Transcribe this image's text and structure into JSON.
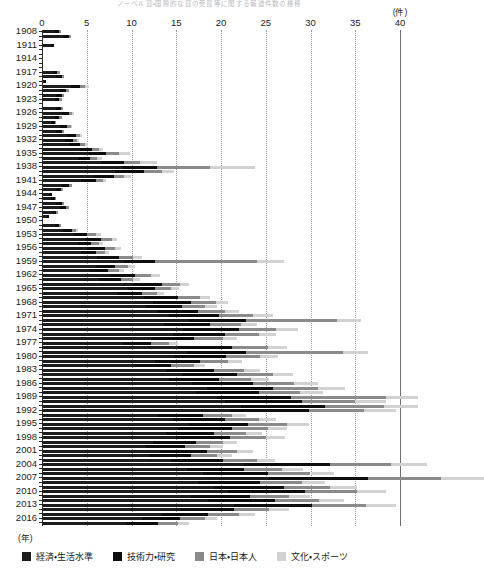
{
  "chart_title": "ノーベル賞・国際的な賞の受賞等に関する報道件数の推移",
  "axis": {
    "x_unit": "(件)",
    "y_unit": "(年)",
    "xticks": [
      0,
      5,
      10,
      15,
      20,
      25,
      30,
      35,
      40
    ],
    "xlim": [
      0,
      40
    ],
    "ytick_labels": [
      "1908",
      "1911",
      "1914",
      "1917",
      "1920",
      "1923",
      "1926",
      "1929",
      "1932",
      "1935",
      "1938",
      "1941",
      "1944",
      "1947",
      "1950",
      "1953",
      "1956",
      "1959",
      "1962",
      "1965",
      "1968",
      "1971",
      "1974",
      "1977",
      "1980",
      "1983",
      "1986",
      "1989",
      "1992",
      "1995",
      "1998",
      "2001",
      "2004",
      "2007",
      "2010",
      "2013",
      "2016"
    ]
  },
  "legend": {
    "items": [
      {
        "label": "経済・生活水準",
        "color": "#1c1c1c",
        "icon": "square-swatch-icon"
      },
      {
        "label": "技術力・研究",
        "color": "#0d0d0d",
        "icon": "square-swatch-icon"
      },
      {
        "label": "日本・日本人",
        "color": "#8a8a8a",
        "icon": "square-swatch-icon"
      },
      {
        "label": "文化・スポーツ",
        "color": "#d2d2d2",
        "icon": "square-swatch-icon"
      }
    ]
  },
  "chart_data": {
    "type": "bar",
    "orientation": "horizontal",
    "stacked": true,
    "title": "ノーベル賞・国際的な賞の受賞等に関する報道件数の推移",
    "xlabel": "(件)",
    "ylabel": "(年)",
    "xlim": [
      0,
      40
    ],
    "grid": true,
    "legend_position": "bottom",
    "series": [
      {
        "name": "経済・生活水準",
        "color": "#1c1c1c"
      },
      {
        "name": "技術力・研究",
        "color": "#0d0d0d"
      },
      {
        "name": "日本・日本人",
        "color": "#8a8a8a"
      },
      {
        "name": "文化・スポーツ",
        "color": "#d2d2d2"
      }
    ],
    "categories": [
      1908,
      1909,
      1910,
      1911,
      1912,
      1913,
      1914,
      1915,
      1916,
      1917,
      1918,
      1919,
      1920,
      1921,
      1922,
      1923,
      1924,
      1925,
      1926,
      1927,
      1928,
      1929,
      1930,
      1931,
      1932,
      1933,
      1934,
      1935,
      1936,
      1937,
      1938,
      1939,
      1940,
      1941,
      1942,
      1943,
      1944,
      1945,
      1946,
      1947,
      1948,
      1949,
      1950,
      1951,
      1952,
      1953,
      1954,
      1955,
      1956,
      1957,
      1958,
      1959,
      1960,
      1961,
      1962,
      1963,
      1964,
      1965,
      1966,
      1967,
      1968,
      1969,
      1970,
      1971,
      1972,
      1973,
      1974,
      1975,
      1976,
      1977,
      1978,
      1979,
      1980,
      1981,
      1982,
      1983,
      1984,
      1985,
      1986,
      1987,
      1988,
      1989,
      1990,
      1991,
      1992,
      1993,
      1994,
      1995,
      1996,
      1997,
      1998,
      1999,
      2000,
      2001,
      2002,
      2003,
      2004,
      2005,
      2006,
      2007,
      2008,
      2009,
      2010,
      2011,
      2012,
      2013,
      2014,
      2015,
      2016,
      2017
    ],
    "values": [
      [
        1.4,
        0.5,
        0.2,
        0.0
      ],
      [
        2.4,
        0.6,
        0.2,
        0.0
      ],
      [
        0.0,
        0.0,
        0.0,
        0.0
      ],
      [
        1.0,
        0.3,
        0.0,
        0.0
      ],
      [
        0.0,
        0.0,
        0.0,
        0.0
      ],
      [
        0.0,
        0.0,
        0.0,
        0.0
      ],
      [
        0.0,
        0.0,
        0.0,
        0.0
      ],
      [
        0.0,
        0.0,
        0.0,
        0.0
      ],
      [
        0.0,
        0.0,
        0.0,
        0.0
      ],
      [
        1.2,
        0.5,
        0.3,
        0.0
      ],
      [
        1.6,
        0.6,
        0.3,
        0.0
      ],
      [
        0.3,
        0.2,
        0.0,
        0.0
      ],
      [
        3.2,
        1.0,
        0.6,
        0.4
      ],
      [
        2.0,
        0.7,
        0.3,
        0.0
      ],
      [
        1.6,
        0.6,
        0.3,
        0.0
      ],
      [
        1.4,
        0.5,
        0.3,
        0.0
      ],
      [
        0.0,
        0.0,
        0.0,
        0.0
      ],
      [
        1.6,
        0.5,
        0.3,
        0.0
      ],
      [
        2.2,
        0.8,
        0.4,
        0.2
      ],
      [
        1.4,
        0.5,
        0.3,
        0.0
      ],
      [
        1.0,
        0.4,
        0.2,
        0.0
      ],
      [
        2.0,
        0.8,
        0.4,
        0.2
      ],
      [
        1.6,
        0.6,
        0.3,
        0.0
      ],
      [
        2.8,
        1.0,
        0.5,
        0.2
      ],
      [
        2.6,
        0.9,
        0.4,
        0.2
      ],
      [
        3.0,
        1.2,
        0.6,
        0.3
      ],
      [
        4.2,
        1.4,
        0.8,
        0.4
      ],
      [
        5.2,
        2.0,
        1.4,
        1.2
      ],
      [
        4.0,
        1.4,
        0.8,
        0.5
      ],
      [
        6.6,
        2.6,
        1.8,
        1.8
      ],
      [
        9.0,
        3.8,
        6.0,
        5.0
      ],
      [
        8.2,
        3.2,
        2.0,
        1.4
      ],
      [
        5.8,
        2.2,
        1.2,
        0.8
      ],
      [
        4.4,
        1.6,
        0.8,
        0.4
      ],
      [
        2.2,
        0.8,
        0.4,
        0.0
      ],
      [
        1.6,
        0.5,
        0.2,
        0.0
      ],
      [
        0.8,
        0.3,
        0.0,
        0.0
      ],
      [
        1.0,
        0.4,
        0.2,
        0.0
      ],
      [
        1.6,
        0.6,
        0.3,
        0.0
      ],
      [
        2.0,
        0.7,
        0.3,
        0.0
      ],
      [
        1.2,
        0.4,
        0.2,
        0.0
      ],
      [
        0.6,
        0.2,
        0.0,
        0.0
      ],
      [
        0.0,
        0.0,
        0.0,
        0.0
      ],
      [
        1.4,
        0.5,
        0.2,
        0.0
      ],
      [
        2.4,
        0.9,
        0.5,
        0.2
      ],
      [
        3.6,
        1.4,
        1.0,
        0.6
      ],
      [
        4.8,
        1.8,
        1.2,
        0.6
      ],
      [
        4.0,
        1.5,
        0.9,
        0.4
      ],
      [
        5.0,
        2.0,
        1.2,
        0.6
      ],
      [
        4.4,
        1.6,
        1.0,
        0.5
      ],
      [
        6.2,
        2.4,
        1.6,
        1.0
      ],
      [
        9.2,
        3.4,
        11.4,
        3.0
      ],
      [
        6.0,
        2.2,
        1.4,
        0.8
      ],
      [
        5.4,
        2.0,
        1.2,
        0.6
      ],
      [
        7.6,
        2.8,
        1.8,
        1.0
      ],
      [
        6.4,
        2.4,
        1.4,
        0.8
      ],
      [
        10.2,
        3.2,
        2.0,
        1.0
      ],
      [
        9.6,
        3.0,
        1.8,
        0.9
      ],
      [
        8.4,
        2.8,
        1.6,
        0.8
      ],
      [
        11.4,
        3.8,
        2.4,
        1.2
      ],
      [
        12.4,
        4.2,
        2.8,
        1.4
      ],
      [
        11.6,
        4.0,
        2.6,
        1.4
      ],
      [
        12.8,
        4.6,
        3.0,
        1.6
      ],
      [
        14.2,
        5.6,
        3.8,
        2.2
      ],
      [
        16.4,
        6.4,
        10.2,
        2.6
      ],
      [
        13.6,
        5.2,
        3.4,
        1.8
      ],
      [
        15.8,
        6.2,
        4.2,
        2.4
      ],
      [
        14.6,
        5.8,
        3.8,
        2.0
      ],
      [
        12.2,
        4.8,
        3.2,
        1.6
      ],
      [
        9.0,
        3.2,
        2.0,
        1.0
      ],
      [
        15.2,
        6.0,
        4.0,
        2.2
      ],
      [
        16.2,
        6.6,
        10.8,
        2.8
      ],
      [
        14.8,
        5.8,
        3.8,
        2.0
      ],
      [
        12.6,
        5.0,
        3.2,
        1.6
      ],
      [
        10.4,
        4.0,
        2.6,
        1.2
      ],
      [
        13.8,
        5.4,
        3.4,
        1.8
      ],
      [
        15.6,
        6.2,
        4.0,
        2.2
      ],
      [
        14.2,
        5.6,
        3.6,
        2.0
      ],
      [
        16.8,
        6.8,
        4.6,
        2.6
      ],
      [
        18.4,
        7.4,
        5.0,
        3.0
      ],
      [
        17.2,
        7.0,
        4.6,
        2.6
      ],
      [
        19.6,
        8.2,
        10.6,
        3.6
      ],
      [
        20.4,
        8.6,
        6.0,
        3.4
      ],
      [
        22.2,
        9.4,
        6.6,
        3.8
      ],
      [
        21.0,
        8.8,
        6.2,
        3.6
      ],
      [
        13.0,
        5.0,
        3.2,
        1.6
      ],
      [
        14.6,
        5.8,
        3.8,
        2.0
      ],
      [
        16.4,
        6.6,
        4.4,
        2.4
      ],
      [
        15.2,
        6.0,
        4.0,
        2.2
      ],
      [
        13.8,
        5.4,
        3.6,
        1.8
      ],
      [
        15.0,
        6.0,
        4.0,
        2.2
      ],
      [
        12.4,
        4.8,
        3.0,
        1.6
      ],
      [
        11.6,
        4.4,
        2.8,
        1.4
      ],
      [
        13.2,
        5.2,
        3.4,
        1.8
      ],
      [
        12.0,
        4.6,
        3.0,
        1.6
      ],
      [
        14.4,
        5.8,
        3.8,
        2.0
      ],
      [
        22.6,
        9.6,
        6.8,
        4.0
      ],
      [
        16.2,
        6.4,
        4.2,
        2.4
      ],
      [
        18.0,
        7.2,
        4.8,
        2.6
      ],
      [
        25.4,
        11.0,
        8.2,
        4.8
      ],
      [
        17.4,
        7.0,
        4.6,
        2.6
      ],
      [
        19.2,
        7.8,
        5.2,
        3.0
      ],
      [
        20.8,
        8.6,
        5.8,
        3.2
      ],
      [
        16.6,
        6.6,
        4.4,
        2.4
      ],
      [
        18.6,
        7.4,
        5.0,
        2.8
      ],
      [
        21.4,
        8.8,
        6.0,
        3.4
      ],
      [
        15.4,
        6.0,
        4.0,
        2.2
      ],
      [
        13.4,
        5.2,
        3.4,
        1.8
      ],
      [
        11.2,
        4.2,
        2.8,
        1.4
      ],
      [
        9.4,
        3.6,
        2.2,
        1.2
      ]
    ]
  }
}
